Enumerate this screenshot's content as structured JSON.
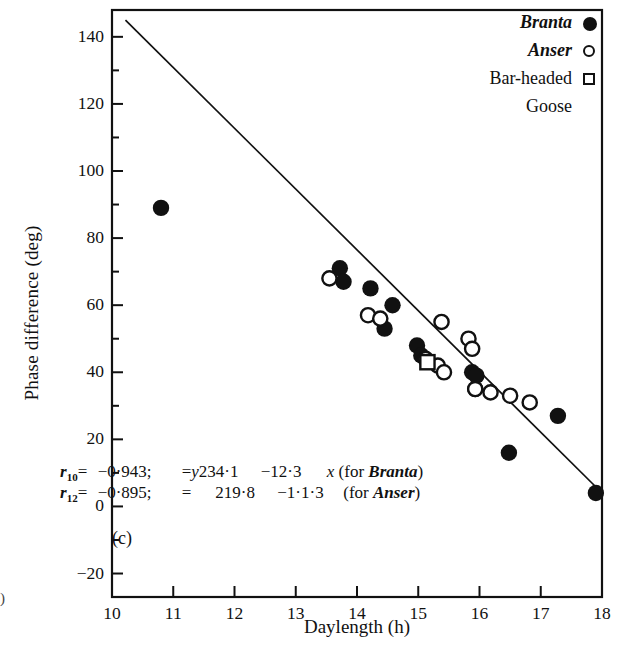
{
  "figure": {
    "panel_label": "(c)",
    "edge_mark": ")"
  },
  "legend": {
    "items": [
      {
        "label": "Branta",
        "marker": "filled-circle",
        "italic": true
      },
      {
        "label": "Anser",
        "marker": "open-circle",
        "italic": true
      },
      {
        "label": "Bar-headed",
        "label2": "Goose",
        "marker": "open-square",
        "italic": false
      }
    ]
  },
  "equations": [
    {
      "r_symbol": "r",
      "r_sub": "10",
      "eq1": "=",
      "r_value": "−0·943;",
      "eq2": "=",
      "y_sym": "y",
      "intercept": "234·1",
      "slope": "−12·3",
      "x_sym": "x",
      "group": "(for Branta)"
    },
    {
      "r_symbol": "r",
      "r_sub": "12",
      "eq1": "=",
      "r_value": "−0·895;",
      "eq2": "=",
      "y_sym": "",
      "intercept": "219·8",
      "slope": "−1·1·3",
      "x_sym": "",
      "group": "(for Anser)"
    }
  ],
  "chart_data": {
    "type": "scatter",
    "title": "",
    "xlabel": "Daylength (h)",
    "ylabel": "Phase difference (deg)",
    "xlim": [
      10,
      18
    ],
    "ylim": [
      -27,
      148
    ],
    "xticks": [
      10,
      11,
      12,
      13,
      14,
      15,
      16,
      17,
      18
    ],
    "yticks": [
      -20,
      0,
      20,
      40,
      60,
      80,
      100,
      120,
      140
    ],
    "yminor": [
      -10,
      10,
      30,
      50,
      70,
      90,
      110,
      130
    ],
    "grid": false,
    "legend_position": "top-right",
    "series": [
      {
        "name": "Branta",
        "marker": "filled-circle",
        "points": [
          [
            10.8,
            89
          ],
          [
            13.72,
            71
          ],
          [
            13.78,
            67
          ],
          [
            14.22,
            65
          ],
          [
            14.58,
            60
          ],
          [
            14.45,
            53
          ],
          [
            14.98,
            48
          ],
          [
            15.05,
            45
          ],
          [
            15.88,
            40
          ],
          [
            15.95,
            39
          ],
          [
            15.93,
            35
          ],
          [
            16.48,
            16
          ],
          [
            17.28,
            27
          ],
          [
            17.9,
            4
          ]
        ]
      },
      {
        "name": "Anser",
        "marker": "open-circle",
        "points": [
          [
            13.55,
            68
          ],
          [
            14.18,
            57
          ],
          [
            14.38,
            56
          ],
          [
            15.12,
            44
          ],
          [
            15.32,
            42
          ],
          [
            15.42,
            40
          ],
          [
            15.38,
            55
          ],
          [
            15.82,
            50
          ],
          [
            15.88,
            47
          ],
          [
            15.93,
            35
          ],
          [
            16.18,
            34
          ],
          [
            16.5,
            33
          ],
          [
            16.82,
            31
          ]
        ]
      },
      {
        "name": "Bar-headed Goose",
        "marker": "open-square",
        "points": [
          [
            15.15,
            43
          ]
        ]
      }
    ],
    "regression_line": {
      "label": "y = 234.1 - 12.3x",
      "x1": 10.22,
      "y1": 145.0,
      "x2": 18.0,
      "y2": 4.0
    }
  }
}
